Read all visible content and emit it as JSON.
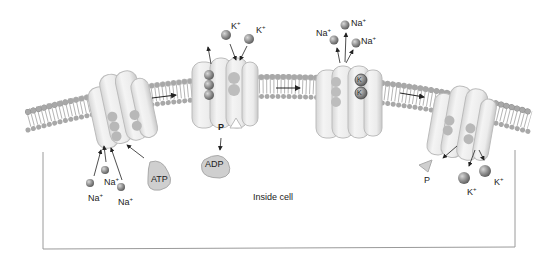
{
  "diagram": {
    "region_label": "Inside cell",
    "colors": {
      "background": "#ffffff",
      "protein": "#e6e6e6",
      "protein_shade": "#c4c4c4",
      "ion": "#8a8a8a",
      "phospholipid_head": "#a8a8a8",
      "arrow": "#222222",
      "cell_border": "#9a9a9a"
    },
    "stages": [
      {
        "id": "stage-1",
        "ions_in": [
          "Na+",
          "Na+",
          "Na+"
        ],
        "molecule": "ATP"
      },
      {
        "id": "stage-2",
        "ions_out": "Na+ ×3 exiting",
        "ions_in_outside": [
          "K+",
          "K+"
        ],
        "phosphate": "P",
        "molecule": "ADP"
      },
      {
        "id": "stage-3",
        "ions_out": [
          "Na+",
          "Na+",
          "Na+"
        ],
        "bound": [
          "K+",
          "K+"
        ]
      },
      {
        "id": "stage-4",
        "released": [
          "K+",
          "K+"
        ],
        "phosphate": "P"
      }
    ],
    "labels": {
      "na": "Na",
      "k": "K",
      "plus": "+",
      "atp": "ATP",
      "adp": "ADP",
      "p": "P",
      "k_bound": "K"
    }
  }
}
